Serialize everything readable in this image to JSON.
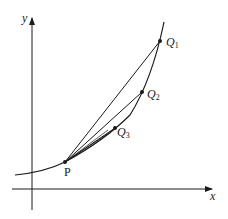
{
  "diagram": {
    "axes": {
      "x_label": "x",
      "y_label": "y"
    },
    "points": {
      "P": {
        "label": "P"
      },
      "Q1": {
        "label": "Q",
        "sub": "1"
      },
      "Q2": {
        "label": "Q",
        "sub": "2"
      },
      "Q3": {
        "label": "Q",
        "sub": "3"
      }
    },
    "colors": {
      "stroke": "#1a1a1a",
      "background": "#ffffff"
    }
  }
}
